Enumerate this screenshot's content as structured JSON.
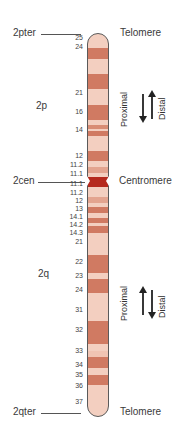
{
  "labels": {
    "pter": "2pter",
    "cen": "2cen",
    "qter": "2qter",
    "p_arm": "2p",
    "q_arm": "2q",
    "telomere_top": "Telomere",
    "centromere": "Centromere",
    "telomere_bottom": "Telomere"
  },
  "p_arm_direction": {
    "proximal": "Proximal",
    "distal": "Distal"
  },
  "q_arm_direction": {
    "proximal": "Proximal",
    "distal": "Distal"
  },
  "band_labels": [
    {
      "text": "25",
      "y": 38
    },
    {
      "text": "24",
      "y": 47
    },
    {
      "text": "21",
      "y": 93
    },
    {
      "text": "16",
      "y": 112
    },
    {
      "text": "14",
      "y": 130
    },
    {
      "text": "12",
      "y": 156
    },
    {
      "text": "11.2",
      "y": 165
    },
    {
      "text": "11.1",
      "y": 174
    },
    {
      "text": "11.1",
      "y": 184
    },
    {
      "text": "11.2",
      "y": 193
    },
    {
      "text": "12",
      "y": 201
    },
    {
      "text": "13",
      "y": 209
    },
    {
      "text": "14.1",
      "y": 217
    },
    {
      "text": "14.2",
      "y": 225
    },
    {
      "text": "14.3",
      "y": 233
    },
    {
      "text": "21",
      "y": 242
    },
    {
      "text": "22",
      "y": 262
    },
    {
      "text": "23",
      "y": 276
    },
    {
      "text": "24",
      "y": 290
    },
    {
      "text": "31",
      "y": 310
    },
    {
      "text": "32",
      "y": 330
    },
    {
      "text": "33",
      "y": 351
    },
    {
      "text": "34",
      "y": 365
    },
    {
      "text": "35",
      "y": 375
    },
    {
      "text": "36",
      "y": 386
    },
    {
      "text": "37",
      "y": 402
    }
  ],
  "colors": {
    "dark_band": "#d07a62",
    "medium_band": "#e3a48f",
    "light_band": "#f3cfc0",
    "centromere": "#b52a1e"
  }
}
